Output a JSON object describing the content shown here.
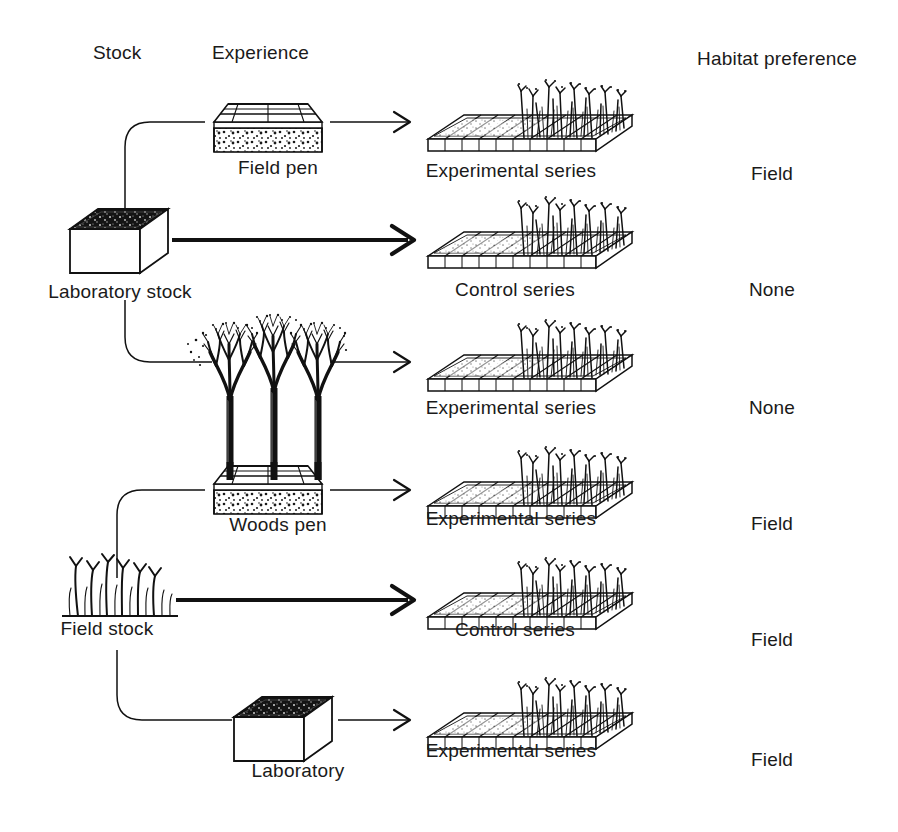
{
  "headers": {
    "stock": "Stock",
    "experience": "Experience",
    "habitat": "Habitat preference"
  },
  "stocks": [
    {
      "id": "laboratory-stock",
      "label": "Laboratory stock",
      "icon": "laboratory-box-icon"
    },
    {
      "id": "field-stock",
      "label": "Field stock",
      "icon": "grass-tuft-icon"
    }
  ],
  "rows": [
    {
      "id": "row-1",
      "stock": "Laboratory stock",
      "experience_label": "Field pen",
      "experience_icon": "field-pen-icon",
      "arrow": "thin",
      "outcome_label": "Experimental series",
      "outcome_icon": "tray-with-grass-icon",
      "habitat": "Field"
    },
    {
      "id": "row-2",
      "stock": "Laboratory stock",
      "experience_label": "",
      "experience_icon": "none",
      "arrow": "thick",
      "outcome_label": "Control series",
      "outcome_icon": "tray-with-grass-icon",
      "habitat": "None"
    },
    {
      "id": "row-3",
      "stock": "Laboratory stock",
      "experience_label": "Woods pen",
      "experience_icon": "woods-pen-icon",
      "arrow": "thin",
      "outcome_label": "Experimental series",
      "outcome_icon": "tray-with-grass-icon",
      "habitat": "None"
    },
    {
      "id": "row-4",
      "stock": "Field stock",
      "experience_label": "Woods pen",
      "experience_icon": "woods-pen-icon",
      "arrow": "thin",
      "outcome_label": "Experimental series",
      "outcome_icon": "tray-with-grass-icon",
      "habitat": "Field"
    },
    {
      "id": "row-5",
      "stock": "Field stock",
      "experience_label": "",
      "experience_icon": "none",
      "arrow": "thick",
      "outcome_label": "Control series",
      "outcome_icon": "tray-with-grass-icon",
      "habitat": "Field"
    },
    {
      "id": "row-6",
      "stock": "Field stock",
      "experience_label": "Laboratory",
      "experience_icon": "laboratory-box-icon",
      "arrow": "thin",
      "outcome_label": "Experimental series",
      "outcome_icon": "tray-with-grass-icon",
      "habitat": "Field"
    }
  ],
  "colors": {
    "ink": "#111111",
    "background": "#ffffff"
  }
}
